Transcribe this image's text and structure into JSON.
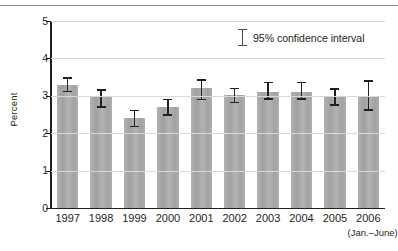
{
  "figure": {
    "ylabel": "Percent",
    "legend_label": "95% confidence interval",
    "legend_icon": "error-bar-icon",
    "x_sub_note": "(Jan.–June)",
    "bar_color": "#a9a9a9",
    "axis_color": "#231f20",
    "grid_color": "#d9d9d9"
  },
  "chart_data": {
    "type": "bar",
    "title": "",
    "xlabel": "",
    "ylabel": "Percent",
    "ylim": [
      0,
      5
    ],
    "yticks": [
      0,
      1,
      2,
      3,
      4,
      5
    ],
    "ytick_labels": [
      "0",
      "1",
      "2",
      "3",
      "4",
      "5"
    ],
    "grid": true,
    "grid_axis": "y",
    "legend": "95% confidence interval",
    "legend_position": "upper right",
    "categories": [
      "1997",
      "1998",
      "1999",
      "2000",
      "2001",
      "2002",
      "2003",
      "2004",
      "2005",
      "2006"
    ],
    "category_notes": [
      "",
      "",
      "",
      "",
      "",
      "",
      "",
      "",
      "",
      "(Jan.–June)"
    ],
    "values": [
      3.3,
      3.0,
      2.4,
      2.7,
      3.2,
      3.03,
      3.11,
      3.11,
      3.0,
      3.0
    ],
    "error_low": [
      3.1,
      2.68,
      2.16,
      2.46,
      2.88,
      2.8,
      2.9,
      2.9,
      2.73,
      2.6
    ],
    "error_high": [
      3.5,
      3.17,
      2.63,
      2.92,
      3.45,
      3.22,
      3.38,
      3.38,
      3.2,
      3.42
    ],
    "errorbar_type": "95% confidence interval"
  }
}
